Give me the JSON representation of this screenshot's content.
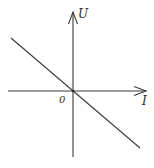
{
  "diagram": {
    "type": "U-I graph",
    "axes": {
      "y_label": "U",
      "x_label": "I",
      "origin_label": "0"
    },
    "line": {
      "description": "straight line through origin with negative slope",
      "slope_sign": "negative"
    },
    "colors": {
      "stroke": "#3a3a3a",
      "background": "#ffffff",
      "text": "#2a2a2a"
    }
  }
}
